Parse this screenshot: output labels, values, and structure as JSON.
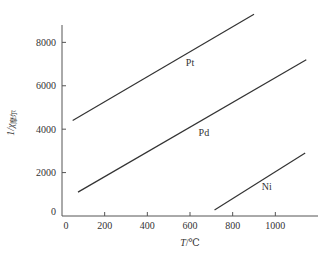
{
  "chart_data": {
    "type": "line",
    "title": "",
    "xlabel": "T/℃",
    "xlabel_var": "T",
    "xlabel_unit": "/℃",
    "ylabel": "1/χ摩尔",
    "ylabel_main": "1/χ",
    "ylabel_sub": "摩尔",
    "xlim": [
      0,
      1200
    ],
    "ylim": [
      0,
      8800
    ],
    "xticks": [
      0,
      200,
      400,
      600,
      800,
      1000
    ],
    "xtick_labels": [
      "0",
      "200",
      "400",
      "600",
      "800",
      "1000"
    ],
    "yticks": [
      0,
      2000,
      4000,
      6000,
      8000
    ],
    "ytick_labels": [
      "0",
      "2000",
      "4000",
      "6000",
      "8000"
    ],
    "grid": false,
    "legend": "none (inline series labels)",
    "series": [
      {
        "name": "Pt",
        "x": [
          50,
          900
        ],
        "y": [
          4400,
          9300
        ],
        "label_at": [
          600,
          6900
        ]
      },
      {
        "name": "Pd",
        "x": [
          75,
          1145
        ],
        "y": [
          1100,
          7200
        ],
        "label_at": [
          665,
          3700
        ]
      },
      {
        "name": "Ni",
        "x": [
          715,
          1140
        ],
        "y": [
          280,
          2900
        ],
        "label_at": [
          960,
          1200
        ]
      }
    ]
  }
}
